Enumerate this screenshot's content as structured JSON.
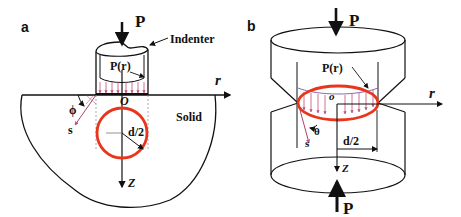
{
  "panels": {
    "a": {
      "label": "a",
      "load": "P",
      "indenter": "Indenter",
      "pressure": "P(r)",
      "r_axis": "r",
      "origin": "O",
      "angle": "ϕ",
      "s_axis": "s",
      "material": "Solid",
      "radius": "d/2",
      "z_axis": "Z"
    },
    "b": {
      "label": "b",
      "load_top": "P",
      "load_bottom": "P",
      "pressure": "P(r)",
      "r_axis": "r",
      "origin": "o",
      "angle": "θ",
      "s_axis": "s",
      "radius": "d/2",
      "z_axis": "Z"
    }
  },
  "colors": {
    "line": "#111111",
    "contact_circle": "#e8361c",
    "pressure_arrows": "#c0507a",
    "s_vector": "#b0406a"
  }
}
